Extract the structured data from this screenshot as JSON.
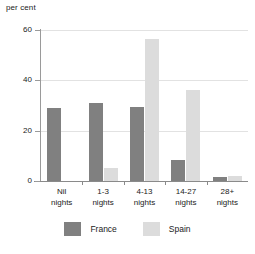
{
  "chart_data": {
    "type": "bar",
    "title": "",
    "subtitle": "",
    "xlabel": "",
    "ylabel": "per cent",
    "ylim": [
      0,
      60
    ],
    "yticks": [
      0,
      20,
      40,
      60
    ],
    "grid": true,
    "legend_position": "bottom",
    "categories": [
      {
        "line1": "Nil",
        "line2": "nights"
      },
      {
        "line1": "1-3",
        "line2": "nights"
      },
      {
        "line1": "4-13",
        "line2": "nights"
      },
      {
        "line1": "14-27",
        "line2": "nights"
      },
      {
        "line1": "28+",
        "line2": "nights"
      }
    ],
    "category_labels": [
      "Nil nights",
      "1-3 nights",
      "4-13 nights",
      "14-27 nights",
      "28+ nights"
    ],
    "series": [
      {
        "name": "France",
        "color": "#808080",
        "values": [
          29,
          31,
          29.5,
          8.5,
          1.5
        ]
      },
      {
        "name": "Spain",
        "color": "#dcdcdc",
        "values": [
          0,
          5,
          56.5,
          36,
          2
        ]
      }
    ]
  },
  "axis": {
    "unit_caption": "per cent",
    "tick_labels": [
      "60",
      "40",
      "20",
      "0"
    ]
  },
  "legend": {
    "items": [
      {
        "label": "France",
        "color": "#808080"
      },
      {
        "label": "Spain",
        "color": "#dcdcdc"
      }
    ]
  },
  "colors": {
    "france": "#808080",
    "spain": "#dcdcdc",
    "axis": "#8a8a8a",
    "grid": "#e2e2e2",
    "text": "#222222",
    "background": "#ffffff"
  }
}
